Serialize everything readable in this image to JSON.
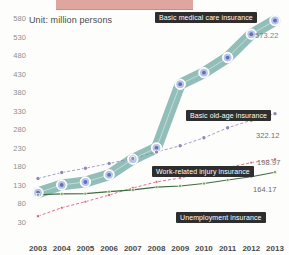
{
  "unit_note": "Unit: million persons",
  "axis": {
    "y_ticks": [
      "580",
      "530",
      "480",
      "430",
      "380",
      "330",
      "280",
      "230",
      "180",
      "130",
      "80",
      "30"
    ],
    "x_ticks": [
      "2003",
      "2004",
      "2005",
      "2006",
      "2007",
      "2008",
      "2009",
      "2010",
      "2011",
      "2012",
      "2013"
    ]
  },
  "callouts": {
    "medical": "Basic medical care insurance",
    "oldage": "Basic old-age insurance",
    "injury": "Work-related injury insurance",
    "unemployment": "Unemployment insurance"
  },
  "end_values": {
    "medical": "573.22",
    "oldage": "322.12",
    "injury": "198.97",
    "unemployment": "164.17"
  },
  "colors": {
    "medical_band": "#7fb3ad",
    "medical_marker": "#6f7fc4",
    "oldage": "#8f87b8",
    "injury": "#e0607f",
    "unemployment": "#3f6b43",
    "callout_bg": "#2e2e2e",
    "title_bar": "#dfa69f"
  },
  "chart_data": {
    "type": "line",
    "title": "",
    "subtitle": "",
    "xlabel": "",
    "ylabel": "",
    "unit": "million persons",
    "grid": false,
    "legend_position": "inline-callouts",
    "ylim": [
      30,
      580
    ],
    "x": [
      "2003",
      "2004",
      "2005",
      "2006",
      "2007",
      "2008",
      "2009",
      "2010",
      "2011",
      "2012",
      "2013"
    ],
    "series": [
      {
        "name": "Basic medical care insurance",
        "color": "#6f7fc4",
        "marker": "circle",
        "values": [
          109.02,
          130.0,
          137.83,
          157.32,
          199.46,
          229.77,
          401.47,
          432.63,
          473.43,
          536.41,
          573.22
        ],
        "end_label": "573.22"
      },
      {
        "name": "Basic old-age insurance",
        "color": "#8f87b8",
        "marker": "circle",
        "values": [
          147.3,
          163.53,
          174.88,
          187.66,
          201.37,
          218.91,
          235.5,
          257.07,
          283.91,
          304.27,
          322.12
        ],
        "end_label": "322.12"
      },
      {
        "name": "Work-related injury insurance",
        "color": "#e0607f",
        "marker": "square",
        "values": [
          45.75,
          68.45,
          84.78,
          102.68,
          121.73,
          138.1,
          148.96,
          161.61,
          176.96,
          190.1,
          198.97
        ],
        "end_label": "198.97"
      },
      {
        "name": "Unemployment insurance",
        "color": "#3f6b43",
        "marker": "square",
        "values": [
          103.73,
          105.84,
          106.48,
          111.87,
          116.45,
          124.0,
          127.15,
          133.76,
          143.17,
          152.25,
          164.17
        ],
        "end_label": "164.17"
      }
    ]
  }
}
